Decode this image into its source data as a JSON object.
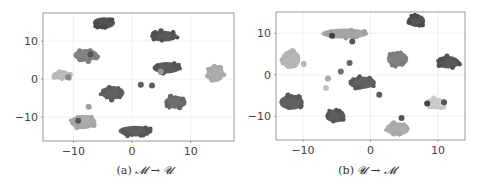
{
  "chart_data": [
    {
      "type": "scatter",
      "title": "",
      "caption": "(a) M → U",
      "caption_prefix": "(a)",
      "caption_math": "𝓜 → 𝓤",
      "xlabel": "",
      "ylabel": "",
      "xlim": [
        -15.2,
        17.4
      ],
      "ylim": [
        -16.3,
        17.4
      ],
      "xticks": [
        -10,
        0,
        10
      ],
      "yticks": [
        -10,
        0,
        10
      ],
      "xtick_labels": [
        "−10",
        "0",
        "10"
      ],
      "ytick_labels": [
        "−10",
        "0",
        "10"
      ],
      "grid": true,
      "legend": null,
      "clusters": [
        {
          "x": -4.8,
          "y": 14.8,
          "rx": 1.9,
          "ry": 1.5,
          "color": "#4a4a4a"
        },
        {
          "x": 5.4,
          "y": 11.3,
          "rx": 2.3,
          "ry": 1.4,
          "color": "#505050"
        },
        {
          "x": -7.9,
          "y": 6.3,
          "rx": 2.1,
          "ry": 1.6,
          "color": "#7d7d7d"
        },
        {
          "x": -12.0,
          "y": 1.0,
          "rx": 1.7,
          "ry": 1.2,
          "color": "#b7b7b7"
        },
        {
          "x": 5.9,
          "y": 3.0,
          "rx": 2.4,
          "ry": 1.5,
          "color": "#525252"
        },
        {
          "x": 14.2,
          "y": 1.5,
          "rx": 1.5,
          "ry": 2.3,
          "color": "#a9a9a9"
        },
        {
          "x": -3.3,
          "y": -3.6,
          "rx": 2.0,
          "ry": 1.8,
          "color": "#5b5b5b"
        },
        {
          "x": 7.4,
          "y": -6.1,
          "rx": 1.9,
          "ry": 1.7,
          "color": "#666666"
        },
        {
          "x": -8.3,
          "y": -11.3,
          "rx": 2.2,
          "ry": 1.9,
          "color": "#a5a5a5"
        },
        {
          "x": 0.6,
          "y": -13.7,
          "rx": 2.9,
          "ry": 1.4,
          "color": "#555555"
        }
      ],
      "points": [
        {
          "x": 1.5,
          "y": -1.5,
          "color": "#5e5e5e"
        },
        {
          "x": 3.4,
          "y": -1.7,
          "color": "#5e5e5e"
        },
        {
          "x": -7.4,
          "y": -7.3,
          "color": "#a0a0a0"
        },
        {
          "x": -9.2,
          "y": -11.0,
          "color": "#555555"
        },
        {
          "x": 4.9,
          "y": 1.9,
          "color": "#999999"
        },
        {
          "x": -10.9,
          "y": 0.5,
          "color": "#888888"
        },
        {
          "x": -7.1,
          "y": 6.5,
          "color": "#555555"
        }
      ]
    },
    {
      "type": "scatter",
      "title": "",
      "caption": "(b) U → M",
      "caption_prefix": "(b)",
      "caption_math": "𝓤 → 𝓜",
      "xlabel": "",
      "ylabel": "",
      "xlim": [
        -14.0,
        14.0
      ],
      "ylim": [
        -15.7,
        15.1
      ],
      "xticks": [
        -10,
        0,
        10
      ],
      "yticks": [
        -10,
        0,
        10
      ],
      "xtick_labels": [
        "−10",
        "0",
        "10"
      ],
      "ytick_labels": [
        "−10",
        "0",
        "10"
      ],
      "grid": true,
      "legend": null,
      "clusters": [
        {
          "x": 6.8,
          "y": 13.0,
          "rx": 1.3,
          "ry": 1.5,
          "color": "#4a4a4a"
        },
        {
          "x": -3.8,
          "y": 9.9,
          "rx": 3.5,
          "ry": 1.2,
          "color": "#a0a0a0"
        },
        {
          "x": -11.8,
          "y": 3.7,
          "rx": 1.4,
          "ry": 2.3,
          "color": "#b2b2b2"
        },
        {
          "x": 4.0,
          "y": 3.8,
          "rx": 1.6,
          "ry": 1.8,
          "color": "#7a7a7a"
        },
        {
          "x": 11.5,
          "y": 3.0,
          "rx": 1.7,
          "ry": 1.5,
          "color": "#4f4f4f"
        },
        {
          "x": -1.2,
          "y": -1.9,
          "rx": 2.0,
          "ry": 1.5,
          "color": "#5a5a5a"
        },
        {
          "x": -11.7,
          "y": -6.6,
          "rx": 1.8,
          "ry": 1.8,
          "color": "#595959"
        },
        {
          "x": -5.2,
          "y": -9.9,
          "rx": 1.5,
          "ry": 1.6,
          "color": "#555555"
        },
        {
          "x": 9.7,
          "y": -6.9,
          "rx": 1.5,
          "ry": 1.4,
          "color": "#c9c9c9"
        },
        {
          "x": 4.0,
          "y": -13.0,
          "rx": 1.8,
          "ry": 1.6,
          "color": "#a8a8a8"
        }
      ],
      "points": [
        {
          "x": -2.7,
          "y": 8.0,
          "color": "#555555"
        },
        {
          "x": -3.1,
          "y": 2.8,
          "color": "#666666"
        },
        {
          "x": -4.4,
          "y": 0.8,
          "color": "#707070"
        },
        {
          "x": -6.3,
          "y": -0.9,
          "color": "#a8a8a8"
        },
        {
          "x": -6.6,
          "y": -3.2,
          "color": "#c0c0c0"
        },
        {
          "x": 1.3,
          "y": -4.8,
          "color": "#5a5a5a"
        },
        {
          "x": -9.9,
          "y": 2.6,
          "color": "#b8b8b8"
        },
        {
          "x": -5.7,
          "y": 9.4,
          "color": "#444444"
        },
        {
          "x": 8.4,
          "y": -6.9,
          "color": "#444444"
        },
        {
          "x": 10.9,
          "y": -6.6,
          "color": "#555555"
        },
        {
          "x": 4.6,
          "y": -10.4,
          "color": "#555555"
        }
      ]
    }
  ],
  "panels": [
    {
      "box": {
        "left": 43,
        "top": 13,
        "right": 234,
        "bottom": 141
      },
      "caption": {
        "prefix": "(a)",
        "math": "𝓜 → 𝓤"
      }
    },
    {
      "box": {
        "left": 276,
        "top": 12,
        "right": 465,
        "bottom": 140
      },
      "caption": {
        "prefix": "(b)",
        "math": "𝓤 → 𝓜"
      }
    }
  ],
  "style": {
    "axis_color": "#9a9a9a",
    "grid_color": "#ececec",
    "tick_label_color": "#444444",
    "caption_color": "#333333"
  }
}
